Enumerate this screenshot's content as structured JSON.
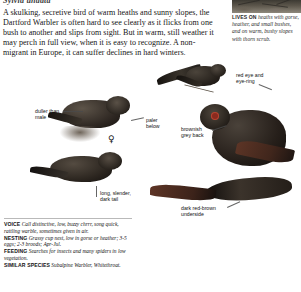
{
  "species": {
    "scientific_name": "Sylvia undata"
  },
  "intro": {
    "text": "A skulking, secretive bird of warm heaths and sunny slopes, the Dartford Warbler is often hard to see clearly as it flicks from one bush to another and slips from sight. But in warm, still weather it may perch in full view, when it is easy to recognize. A non-migrant in Europe, it can suffer declines in hard winters."
  },
  "habitat": {
    "heading": "LIVES ON",
    "text": "heaths with gorse, heather, and small bushes, and on warm, bushy slopes with thorn scrub."
  },
  "labels": {
    "duller_than_male": "duller than\nmale",
    "paler_below": "paler\nbelow",
    "brownish_grey_back": "brownish\ngrey back",
    "red_eye_and_eye_ring": "red eye and\neye-ring",
    "long_slender_dark_tail": "long, slender,\ndark tail",
    "dark_red_brown_underside": "dark red-brown\nunderside"
  },
  "symbols": {
    "female": "♀"
  },
  "facts": [
    {
      "key": "VOICE",
      "value": "Call distinctive, low, buzzy chrrr, song quick, rattling warble, sometimes given in air."
    },
    {
      "key": "NESTING",
      "value": "Grassy cup nest, low in gorse or heather; 3-5 eggs; 2-3 broods; Apr-Jul."
    },
    {
      "key": "FEEDING",
      "value": "Searches for insects and many spiders in low vegetation."
    },
    {
      "key": "SIMILAR SPECIES",
      "value": "Subalpine Warbler, Whitethroat."
    }
  ],
  "colors": {
    "plumage_dark": "#2b2722",
    "plumage_rust": "#6b3f30",
    "text": "#121212",
    "rule": "#b9b9b9"
  }
}
